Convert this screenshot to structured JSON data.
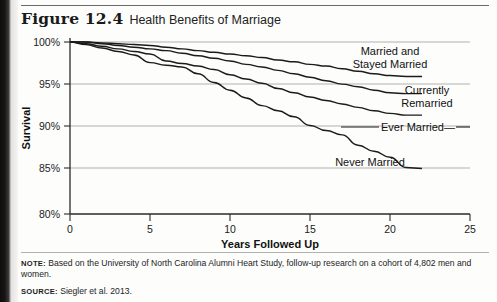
{
  "figure": {
    "number": "Figure 12.4",
    "title": "Health Benefits of Marriage"
  },
  "notes": {
    "note_label": "NOTE:",
    "note_text": " Based on the University of North Carolina Alumni Heart Study, follow-up research on a cohort of 4,802 men and women.",
    "source_label": "SOURCE:",
    "source_text": " Siegler et al. 2013."
  },
  "chart_data": {
    "type": "line",
    "title": "Health Benefits of Marriage",
    "xlabel": "Years Followed Up",
    "ylabel": "Survival",
    "xlim": [
      0,
      25
    ],
    "ylim": [
      80,
      100
    ],
    "xticks": [
      0,
      5,
      10,
      15,
      20,
      25
    ],
    "xtick_labels": [
      "0",
      "5",
      "10",
      "15",
      "20",
      "25"
    ],
    "yticks": [
      80,
      85,
      90,
      95,
      100
    ],
    "ytick_labels": [
      "80%",
      "85%",
      "90%",
      "95%",
      "100%"
    ],
    "grid": "horizontal",
    "legend": "inline-annotations",
    "series": [
      {
        "name": "Married and Stayed Married",
        "label": "Married and\nStayed Married",
        "label_line1": "Married and",
        "label_line2": "Stayed Married",
        "color": "#1b1b1b",
        "x": [
          0,
          1,
          2,
          3,
          4,
          5,
          6,
          7,
          8,
          9,
          10,
          11,
          12,
          13,
          14,
          15,
          16,
          17,
          18,
          19,
          20,
          21,
          22
        ],
        "y": [
          100,
          100,
          99.9,
          99.8,
          99.7,
          99.6,
          99.4,
          99.2,
          99.0,
          98.8,
          98.6,
          98.4,
          98.2,
          97.9,
          97.7,
          97.4,
          97.2,
          96.9,
          96.6,
          96.3,
          96.1,
          96.0,
          96.0
        ]
      },
      {
        "name": "Currently Remarried",
        "label": "Currently\nRemarried",
        "label_line1": "Currently",
        "label_line2": "Remarried",
        "color": "#1b1b1b",
        "x": [
          0,
          1,
          2,
          3,
          4,
          5,
          6,
          7,
          8,
          9,
          10,
          11,
          12,
          13,
          14,
          15,
          16,
          17,
          18,
          19,
          20,
          21,
          22
        ],
        "y": [
          100,
          100,
          99.8,
          99.6,
          99.4,
          99.2,
          99.0,
          98.7,
          98.4,
          98.1,
          97.8,
          97.4,
          97.1,
          96.7,
          96.3,
          95.9,
          95.5,
          95.1,
          94.8,
          94.4,
          94.1,
          94.0,
          94.0
        ]
      },
      {
        "name": "Ever Married",
        "label": "Ever Married—",
        "label_line1": "Ever Married—",
        "color": "#1b1b1b",
        "x": [
          0,
          1,
          2,
          3,
          4,
          5,
          6,
          7,
          8,
          9,
          10,
          11,
          12,
          13,
          14,
          15,
          16,
          17,
          18,
          19,
          20,
          21,
          22
        ],
        "y": [
          100,
          99.8,
          99.5,
          99.2,
          98.9,
          98.6,
          97.8,
          97.5,
          97.2,
          96.8,
          96.2,
          95.7,
          95.2,
          94.6,
          94.1,
          93.6,
          93.2,
          92.8,
          92.4,
          92.0,
          91.7,
          91.5,
          91.5
        ]
      },
      {
        "name": "Never Married",
        "label": "Never Married",
        "label_line1": "Never Married",
        "color": "#1b1b1b",
        "x": [
          0,
          1,
          2,
          3,
          4,
          5,
          6,
          7,
          8,
          9,
          10,
          11,
          12,
          13,
          14,
          15,
          16,
          17,
          18,
          19,
          20,
          21,
          22
        ],
        "y": [
          100,
          99.7,
          99.3,
          98.9,
          98.5,
          97.6,
          97.3,
          97.1,
          96.3,
          95.3,
          94.4,
          93.5,
          92.6,
          92.0,
          91.3,
          90.3,
          89.7,
          89.2,
          88.0,
          87.3,
          86.6,
          85.4,
          85.3
        ]
      }
    ]
  }
}
